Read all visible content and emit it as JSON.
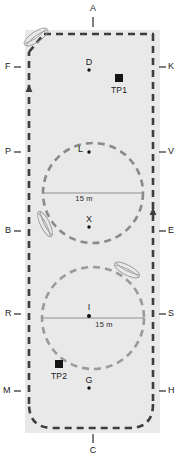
{
  "figure": {
    "type": "field-diagram",
    "width": 179,
    "height": 462,
    "background_color": "#ffffff",
    "field_fill_color": "#e8e8e8",
    "boundary_color": "#3a3a3a",
    "circle_color": "#8c8c8c",
    "marker_color": "#000000"
  },
  "field": {
    "name": "enclosure-outline",
    "fill": "#e8e8e8",
    "boundary_style": "dashed"
  },
  "circles": [
    {
      "id": "circle-upper",
      "center_label": "L",
      "diameter_label": "15 m",
      "cx": 93,
      "cy": 193,
      "r": 50,
      "line": "diameter"
    },
    {
      "id": "circle-lower",
      "center_label": "I",
      "diameter_label": "15 m",
      "cx": 93,
      "cy": 318,
      "r": 51,
      "line": "diameter"
    }
  ],
  "points": [
    {
      "id": "point-d",
      "label": "D",
      "x": 89,
      "y": 70,
      "marker": "dot"
    },
    {
      "id": "point-l",
      "label": "L",
      "x": 89,
      "y": 152,
      "marker": "dot"
    },
    {
      "id": "point-x",
      "label": "X",
      "x": 89,
      "y": 227,
      "marker": "dot"
    },
    {
      "id": "point-i",
      "label": "I",
      "x": 89,
      "y": 316,
      "marker": "dot"
    },
    {
      "id": "point-g",
      "label": "G",
      "x": 89,
      "y": 388,
      "marker": "dot"
    }
  ],
  "stations": [
    {
      "id": "station-tp1",
      "label": "TP1",
      "x": 119,
      "y": 78,
      "marker": "square"
    },
    {
      "id": "station-tp2",
      "label": "TP2",
      "x": 59,
      "y": 364,
      "marker": "square"
    }
  ],
  "edge_labels": {
    "top": [
      {
        "id": "edge-a",
        "label": "A",
        "x": 93,
        "y": 8
      }
    ],
    "bottom": [
      {
        "id": "edge-c",
        "label": "C",
        "x": 93,
        "y": 448
      }
    ],
    "left": [
      {
        "id": "edge-f",
        "label": "F",
        "y": 67
      },
      {
        "id": "edge-p",
        "label": "P",
        "y": 152
      },
      {
        "id": "edge-b",
        "label": "B",
        "y": 231
      },
      {
        "id": "edge-r",
        "label": "R",
        "y": 314
      },
      {
        "id": "edge-m",
        "label": "M",
        "y": 391
      }
    ],
    "right": [
      {
        "id": "edge-k",
        "label": "K",
        "y": 67
      },
      {
        "id": "edge-v",
        "label": "V",
        "y": 152
      },
      {
        "id": "edge-e",
        "label": "E",
        "y": 231
      },
      {
        "id": "edge-s",
        "label": "S",
        "y": 314
      },
      {
        "id": "edge-h",
        "label": "H",
        "y": 391
      }
    ]
  },
  "leaves": [
    {
      "id": "leaf-top-left",
      "x": 36,
      "y": 37,
      "rotation": -38
    },
    {
      "id": "leaf-mid-left",
      "x": 45,
      "y": 224,
      "rotation": 65
    },
    {
      "id": "leaf-right",
      "x": 127,
      "y": 270,
      "rotation": 30
    }
  ],
  "arrows": [
    {
      "id": "arrow-left-up",
      "x": 27,
      "y": 92,
      "direction": "up"
    },
    {
      "id": "arrow-right-up",
      "x": 148,
      "y": 215,
      "direction": "up"
    }
  ]
}
